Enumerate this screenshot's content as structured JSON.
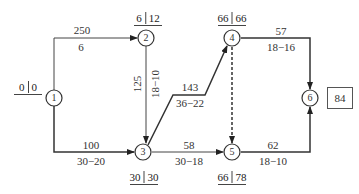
{
  "diagram": {
    "type": "network-schedule",
    "nodes": [
      {
        "id": "1",
        "label": "1",
        "times": [
          "0",
          "0"
        ]
      },
      {
        "id": "2",
        "label": "2",
        "times": [
          "6",
          "12"
        ]
      },
      {
        "id": "3",
        "label": "3",
        "times": [
          "30",
          "30"
        ]
      },
      {
        "id": "4",
        "label": "4",
        "times": [
          "66",
          "66"
        ]
      },
      {
        "id": "5",
        "label": "5",
        "times": [
          "66",
          "78"
        ]
      },
      {
        "id": "6",
        "label": "6",
        "total": "84"
      }
    ],
    "edges": [
      {
        "from": "1",
        "to": "2",
        "top": "250",
        "bottom": "6",
        "style": "solid"
      },
      {
        "from": "1",
        "to": "3",
        "top": "100",
        "bottom": "30−20",
        "style": "solid"
      },
      {
        "from": "2",
        "to": "3",
        "top": "125",
        "bottom": "18−10",
        "style": "solid"
      },
      {
        "from": "3",
        "to": "4",
        "top": "143",
        "bottom": "36−22",
        "style": "solid"
      },
      {
        "from": "3",
        "to": "5",
        "top": "58",
        "bottom": "30−18",
        "style": "solid"
      },
      {
        "from": "4",
        "to": "5",
        "top": "",
        "bottom": "",
        "style": "dashed"
      },
      {
        "from": "4",
        "to": "6",
        "top": "57",
        "bottom": "18−16",
        "style": "solid"
      },
      {
        "from": "5",
        "to": "6",
        "top": "62",
        "bottom": "18−10",
        "style": "solid"
      }
    ]
  }
}
